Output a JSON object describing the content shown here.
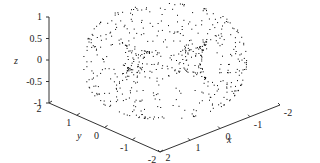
{
  "chart_data": {
    "type": "scatter",
    "projection": "3d",
    "title": "",
    "xlabel": "x",
    "ylabel": "y",
    "zlabel": "z",
    "xlim": [
      -2,
      2
    ],
    "ylim": [
      -2,
      2
    ],
    "zlim": [
      -1,
      1
    ],
    "x_ticks": [
      "2",
      "1",
      "0",
      "-1",
      "-2"
    ],
    "y_ticks": [
      "2",
      "1",
      "0",
      "-1",
      "-2"
    ],
    "z_ticks": [
      "1",
      "0.5",
      "0",
      "-0.5",
      "-1"
    ],
    "grid": false,
    "legend": null,
    "marker_color": "#000000",
    "approx_point_count": 600
  },
  "axes": {
    "z_label": "z",
    "y_label": "y",
    "x_label": "x"
  }
}
